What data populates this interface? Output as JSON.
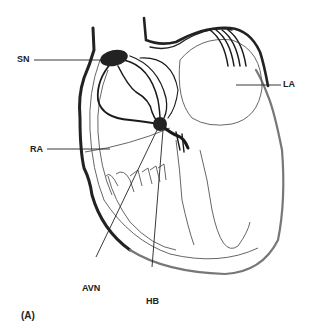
{
  "diagram": {
    "type": "anatomical-illustration",
    "panel_label": "(A)",
    "labels": {
      "sn": "SN",
      "la": "LA",
      "ra": "RA",
      "avn": "AVN",
      "hb": "HB"
    },
    "colors": {
      "background": "#ffffff",
      "conduction_path": "#1a1a1a",
      "outline": "#555555",
      "node_fill": "#222222"
    }
  }
}
